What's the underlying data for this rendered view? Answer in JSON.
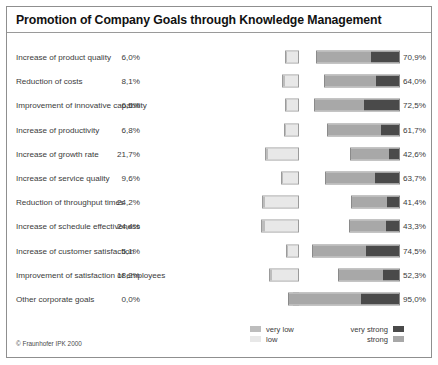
{
  "chart_data": {
    "type": "bar",
    "title": "Promotion of Company Goals through Knowledge Management",
    "subtitle": "",
    "xlabel": "",
    "ylabel": "",
    "orientation": "horizontal",
    "layout": "diverging-two-sided",
    "grid": false,
    "legend_position": "bottom",
    "categories": [
      "Increase of product quality",
      "Reduction of costs",
      "Improvement of innovative capability",
      "Increase of productivity",
      "Increase of growth rate",
      "Increase of service quality",
      "Reduction of throughput times",
      "Increase of schedule effectiveness",
      "Increase of customer satisfaction",
      "Improvement of satisfaction of employees",
      "Other corporate goals"
    ],
    "series": [
      {
        "name": "negative",
        "label_side": "left",
        "values": [
          6.0,
          8.1,
          6.5,
          6.8,
          21.7,
          9.6,
          24.2,
          24.4,
          5.1,
          18.2,
          0.0
        ],
        "value_labels": [
          "6,0%",
          "8,1%",
          "6,5%",
          "6,8%",
          "21,7%",
          "9,6%",
          "24,2%",
          "24,4%",
          "5,1%",
          "18,2%",
          "0,0%"
        ],
        "segments": [
          {
            "name": "very low",
            "values": [
              0.5,
              0.6,
              0.5,
              0.5,
              1.6,
              0.7,
              2.0,
              1.8,
              0.5,
              1.3,
              0.0
            ]
          },
          {
            "name": "low",
            "values": [
              5.5,
              7.5,
              6.0,
              6.3,
              20.1,
              8.9,
              22.2,
              22.6,
              4.6,
              16.9,
              0.0
            ]
          }
        ]
      },
      {
        "name": "positive",
        "label_side": "right",
        "values": [
          70.9,
          64.0,
          72.5,
          61.7,
          42.6,
          63.7,
          41.4,
          43.3,
          74.5,
          52.3,
          95.0
        ],
        "value_labels": [
          "70,9%",
          "64,0%",
          "72,5%",
          "61,7%",
          "42,6%",
          "63,7%",
          "41,4%",
          "43,3%",
          "74,5%",
          "52,3%",
          "95,0%"
        ],
        "segments": [
          {
            "name": "strong",
            "values": [
              47.0,
              44.0,
              42.0,
              46.0,
              33.5,
              43.0,
              31.0,
              31.5,
              46.0,
              38.0,
              62.0
            ]
          },
          {
            "name": "very strong",
            "values": [
              23.9,
              20.0,
              30.5,
              15.7,
              9.1,
              20.7,
              10.4,
              11.8,
              28.5,
              14.3,
              33.0
            ]
          }
        ]
      }
    ],
    "legend": [
      {
        "label": "very low",
        "color": "#bdbdbd"
      },
      {
        "label": "low",
        "color": "#e8e8e8"
      },
      {
        "label": "very strong",
        "color": "#4a4a4a"
      },
      {
        "label": "strong",
        "color": "#a8a8a8"
      }
    ]
  },
  "footer": {
    "copyright": "© Fraunhofer IPK 2000"
  },
  "colors": {
    "very_low": "#bdbdbd",
    "low": "#e8e8e8",
    "strong": "#a8a8a8",
    "very_strong": "#4a4a4a",
    "frame": "#8f8f8f",
    "text": "#3b3b3b"
  }
}
